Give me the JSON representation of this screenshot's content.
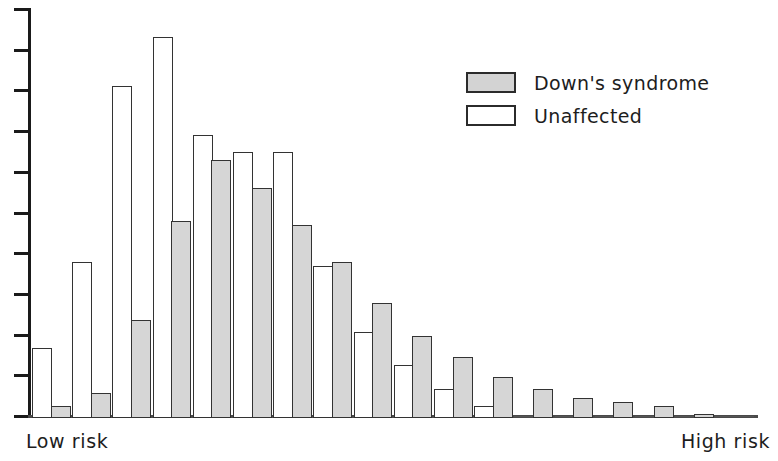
{
  "legend": {
    "position": "top-right",
    "entries": [
      {
        "label": "Down's syndrome",
        "swatch": "gray-filled-swatch",
        "color": "#d3d3d3"
      },
      {
        "label": "Unaffected",
        "swatch": "white-open-swatch",
        "color": "#ffffff"
      }
    ]
  },
  "axis": {
    "low_label": "Low risk",
    "high_label": "High risk",
    "tick_count": 10
  },
  "chart_data": {
    "type": "bar",
    "title": "",
    "subtitle": "",
    "xlabel": "Risk",
    "ylabel": "",
    "grid": false,
    "legend_position": "top-right",
    "xlim_labels": [
      "Low risk",
      "High risk"
    ],
    "ylim": [
      0,
      100
    ],
    "axis_tick_values": [
      0,
      10,
      20,
      30,
      40,
      50,
      60,
      70,
      80,
      90,
      100
    ],
    "categories": [
      "bin-1",
      "bin-2",
      "bin-3",
      "bin-4",
      "bin-5",
      "bin-6",
      "bin-7",
      "bin-8",
      "bin-9",
      "bin-10",
      "bin-11",
      "bin-12",
      "bin-13",
      "bin-14",
      "bin-15",
      "bin-16",
      "bin-17",
      "bin-18"
    ],
    "series": [
      {
        "name": "Unaffected",
        "color": "#ffffff",
        "values": [
          17,
          38,
          81,
          93,
          69,
          65,
          65,
          37,
          21,
          13,
          7,
          3,
          0,
          0,
          0,
          0,
          0,
          0
        ]
      },
      {
        "name": "Down's syndrome",
        "color": "#d3d3d3",
        "values": [
          3,
          6,
          24,
          48,
          63,
          56,
          47,
          38,
          28,
          20,
          15,
          10,
          7,
          5,
          4,
          3,
          1,
          0.5
        ]
      }
    ]
  }
}
